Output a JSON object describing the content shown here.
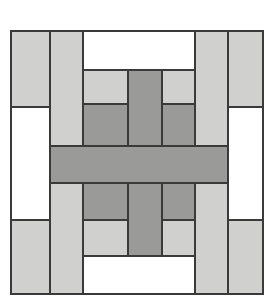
{
  "figure": {
    "title": "Patchwork Block Pattern",
    "description": "Symmetric quilt-block style geometric pattern built from light gray, dark gray and white rectangles with thin dark outlines.",
    "canvas": {
      "width": 274,
      "height": 304,
      "background": "#ffffff"
    }
  },
  "palette": {
    "light_gray": "#d0d0cf",
    "dark_gray": "#9a9a99",
    "white": "#ffffff",
    "outline": "#3a3a3a",
    "outline_width": 1.6
  },
  "block_bounds": {
    "x": 11,
    "y": 31,
    "width": 252,
    "height": 263
  },
  "shapes": [
    {
      "name": "col1-top-light",
      "x": 11,
      "y": 31,
      "w": 39,
      "h": 76,
      "fill": "light_gray"
    },
    {
      "name": "col1-middle-white",
      "x": 11,
      "y": 107,
      "w": 39,
      "h": 113,
      "fill": "white"
    },
    {
      "name": "col1-bottom-light",
      "x": 11,
      "y": 220,
      "w": 39,
      "h": 74,
      "fill": "light_gray"
    },
    {
      "name": "col2-upper-light",
      "x": 50,
      "y": 31,
      "w": 33,
      "h": 115,
      "fill": "light_gray"
    },
    {
      "name": "col2-lower-light",
      "x": 50,
      "y": 183,
      "w": 33,
      "h": 111,
      "fill": "light_gray"
    },
    {
      "name": "center-top-white",
      "x": 83,
      "y": 31,
      "w": 112,
      "h": 39,
      "fill": "white"
    },
    {
      "name": "inner-left-upper-light",
      "x": 83,
      "y": 70,
      "w": 45,
      "h": 34,
      "fill": "light_gray"
    },
    {
      "name": "inner-left-upper-dark",
      "x": 83,
      "y": 104,
      "w": 45,
      "h": 42,
      "fill": "dark_gray"
    },
    {
      "name": "inner-right-upper-light",
      "x": 162,
      "y": 70,
      "w": 33,
      "h": 34,
      "fill": "light_gray"
    },
    {
      "name": "inner-right-upper-dark",
      "x": 162,
      "y": 104,
      "w": 33,
      "h": 42,
      "fill": "dark_gray"
    },
    {
      "name": "center-vertical-bar-upper",
      "x": 128,
      "y": 70,
      "w": 34,
      "h": 76,
      "fill": "dark_gray"
    },
    {
      "name": "center-vertical-bar-lower",
      "x": 128,
      "y": 183,
      "w": 34,
      "h": 73,
      "fill": "dark_gray"
    },
    {
      "name": "inner-left-lower-dark",
      "x": 83,
      "y": 183,
      "w": 45,
      "h": 37,
      "fill": "dark_gray"
    },
    {
      "name": "inner-left-lower-light",
      "x": 83,
      "y": 220,
      "w": 45,
      "h": 36,
      "fill": "light_gray"
    },
    {
      "name": "inner-right-lower-dark",
      "x": 162,
      "y": 183,
      "w": 33,
      "h": 37,
      "fill": "dark_gray"
    },
    {
      "name": "inner-right-lower-light",
      "x": 162,
      "y": 220,
      "w": 33,
      "h": 36,
      "fill": "light_gray"
    },
    {
      "name": "center-bottom-white",
      "x": 83,
      "y": 256,
      "w": 112,
      "h": 38,
      "fill": "white"
    },
    {
      "name": "col4-upper-light",
      "x": 195,
      "y": 31,
      "w": 33,
      "h": 115,
      "fill": "light_gray"
    },
    {
      "name": "col4-lower-light",
      "x": 195,
      "y": 183,
      "w": 33,
      "h": 111,
      "fill": "light_gray"
    },
    {
      "name": "col5-top-light",
      "x": 228,
      "y": 31,
      "w": 35,
      "h": 76,
      "fill": "light_gray"
    },
    {
      "name": "col5-middle-white",
      "x": 228,
      "y": 107,
      "w": 35,
      "h": 113,
      "fill": "white"
    },
    {
      "name": "col5-bottom-light",
      "x": 228,
      "y": 220,
      "w": 35,
      "h": 74,
      "fill": "light_gray"
    },
    {
      "name": "center-horizontal-bar",
      "x": 50,
      "y": 146,
      "w": 178,
      "h": 37,
      "fill": "dark_gray"
    }
  ]
}
